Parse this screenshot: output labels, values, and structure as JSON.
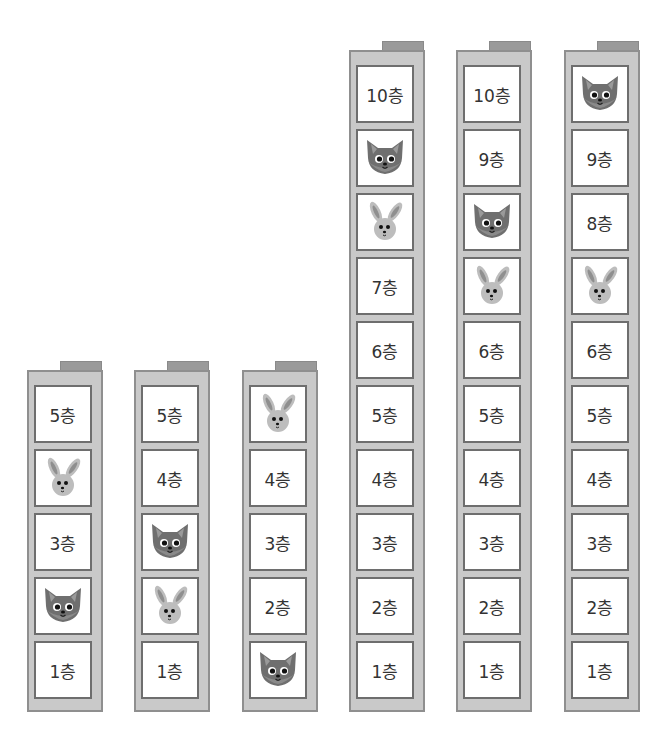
{
  "buildings": [
    {
      "floors": [
        "5층",
        "rabbit",
        "3층",
        "fox",
        "1층"
      ]
    },
    {
      "floors": [
        "5층",
        "4층",
        "fox",
        "rabbit",
        "1층"
      ]
    },
    {
      "floors": [
        "rabbit",
        "4층",
        "3층",
        "2층",
        "fox"
      ]
    },
    {
      "floors": [
        "10층",
        "fox",
        "rabbit",
        "7층",
        "6층",
        "5층",
        "4층",
        "3층",
        "2층",
        "1층"
      ]
    },
    {
      "floors": [
        "10층",
        "9층",
        "fox",
        "rabbit",
        "6층",
        "5층",
        "4층",
        "3층",
        "2층",
        "1층"
      ]
    },
    {
      "floors": [
        "fox",
        "9층",
        "8층",
        "rabbit",
        "6층",
        "5층",
        "4층",
        "3층",
        "2층",
        "1층"
      ]
    }
  ],
  "colors": {
    "frame": "#c9c9c9",
    "frame_border": "#8f8f8f",
    "tab": "#9a9a9a",
    "fox": "#6f6f6f",
    "rabbit": "#bdbdbd"
  }
}
